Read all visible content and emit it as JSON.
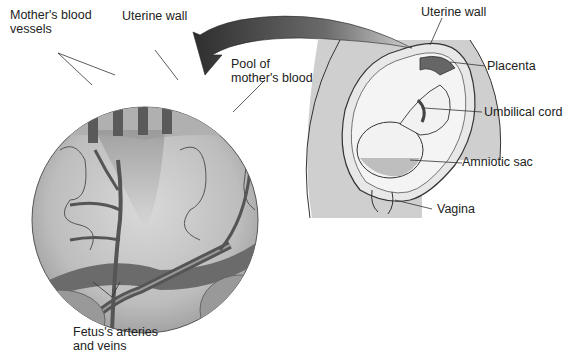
{
  "figure": {
    "labels": {
      "mothers_blood_vessels": [
        "Mother's blood",
        "vessels"
      ],
      "uterine_wall_inset": "Uterine wall",
      "pool_of_mothers_blood": [
        "Pool of",
        "mother's blood"
      ],
      "fetus_arteries_veins": [
        "Fetus's arteries",
        "and veins"
      ],
      "uterine_wall_body": "Uterine wall",
      "placenta": "Placenta",
      "umbilical_cord": "Umbilical cord",
      "amniotic_sac": "Amniotic sac",
      "vagina": "Vagina"
    },
    "colors": {
      "background": "#ffffff",
      "tissue_light": "#c9c9c9",
      "tissue_mid": "#a8a8a8",
      "vessel_dark": "#5a5a5a",
      "body_fill": "#cfcfcf",
      "outline": "#333333",
      "arrow_dark": "#3a3a3a"
    }
  }
}
